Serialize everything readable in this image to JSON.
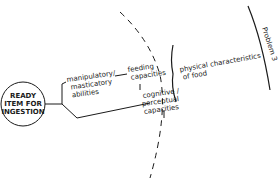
{
  "diagram": {
    "center_node": {
      "lines": [
        "READY",
        "ITEM FOR",
        "INGESTION"
      ]
    },
    "branches": {
      "upper": {
        "lines": [
          "manipulatory/",
          "masticatory",
          "abilities"
        ]
      },
      "feeding": {
        "lines": [
          "feeding",
          "capacities"
        ]
      },
      "cognitive": {
        "lines": [
          "cognitive /",
          "perceptual",
          "capacities"
        ]
      },
      "food": {
        "lines": [
          "physical characteristics",
          "of food"
        ]
      }
    },
    "outer_label": {
      "text": "Problem 3"
    },
    "colors": {
      "ink": "#1a1a1a",
      "background": "#ffffff"
    }
  }
}
